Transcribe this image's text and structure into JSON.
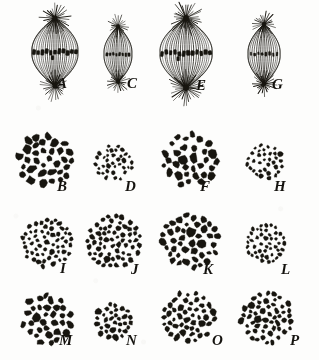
{
  "plate": {
    "kind": "scientific-figure-plate",
    "background_color": "#fdfdfc",
    "ink_color": "#17150f",
    "width": 319,
    "height": 360,
    "rows": 4,
    "columns": 4
  },
  "panels": [
    {
      "id": "A",
      "label": "A",
      "type": "spindle",
      "row": 1,
      "col": 1,
      "cx": 55,
      "cy": 52,
      "spindle_width": 46,
      "spindle_height": 68,
      "fiber_count": 22,
      "aster_rays": 26,
      "aster_radius": 15,
      "chromosome_count": 11,
      "chromosome_size": "large",
      "plate_width": 42,
      "description": "large barrel-shaped mitotic spindle with prominent asters and dense equatorial chromosome plate",
      "label_x": 57,
      "label_y": 89
    },
    {
      "id": "C",
      "label": "C",
      "type": "spindle",
      "row": 1,
      "col": 2,
      "cx": 118,
      "cy": 54,
      "spindle_width": 28,
      "spindle_height": 56,
      "fiber_count": 15,
      "aster_rays": 20,
      "aster_radius": 11,
      "chromosome_count": 8,
      "chromosome_size": "small",
      "plate_width": 22,
      "description": "small narrow spindle with faint equatorial chromosomes",
      "label_x": 127,
      "label_y": 89
    },
    {
      "id": "E",
      "label": "E",
      "type": "spindle",
      "row": 1,
      "col": 3,
      "cx": 186,
      "cy": 53,
      "spindle_width": 52,
      "spindle_height": 70,
      "fiber_count": 24,
      "aster_rays": 30,
      "aster_radius": 17,
      "chromosome_count": 12,
      "chromosome_size": "large",
      "plate_width": 48,
      "description": "large broad spindle with long radiating astral rays and wide chromosome plate",
      "label_x": 196,
      "label_y": 91
    },
    {
      "id": "G",
      "label": "G",
      "type": "spindle",
      "row": 1,
      "col": 4,
      "cx": 264,
      "cy": 54,
      "spindle_width": 32,
      "spindle_height": 60,
      "fiber_count": 16,
      "aster_rays": 22,
      "aster_radius": 12,
      "chromosome_count": 8,
      "chromosome_size": "small",
      "plate_width": 26,
      "description": "medium narrow spindle with small equatorial chromosomes",
      "label_x": 272,
      "label_y": 90
    },
    {
      "id": "B",
      "label": "B",
      "type": "cluster",
      "row": 2,
      "col": 1,
      "cx": 45,
      "cy": 161,
      "radius": 27,
      "dot_count": 40,
      "dot_size": "large",
      "dot_r_min": 2.6,
      "dot_r_max": 4.2,
      "description": "polar view, group of large chromosomes",
      "label_x": 57,
      "label_y": 192
    },
    {
      "id": "D",
      "label": "D",
      "type": "cluster",
      "row": 2,
      "col": 2,
      "cx": 114,
      "cy": 163,
      "radius": 19,
      "dot_count": 36,
      "dot_size": "small",
      "dot_r_min": 1.2,
      "dot_r_max": 2.1,
      "description": "polar view, group of small chromosomes",
      "label_x": 125,
      "label_y": 192
    },
    {
      "id": "F",
      "label": "F",
      "type": "cluster",
      "row": 2,
      "col": 3,
      "cx": 190,
      "cy": 160,
      "radius": 27,
      "dot_count": 38,
      "dot_size": "large",
      "dot_r_min": 2.6,
      "dot_r_max": 4.3,
      "description": "polar view, group of large chromosomes",
      "label_x": 200,
      "label_y": 192
    },
    {
      "id": "H",
      "label": "H",
      "type": "cluster",
      "row": 2,
      "col": 4,
      "cx": 265,
      "cy": 162,
      "radius": 18,
      "dot_count": 34,
      "dot_size": "small",
      "dot_r_min": 1.3,
      "dot_r_max": 2.1,
      "description": "polar view, group of small chromosomes",
      "label_x": 274,
      "label_y": 192
    },
    {
      "id": "I",
      "label": "I",
      "type": "cluster",
      "row": 3,
      "col": 1,
      "cx": 47,
      "cy": 243,
      "radius": 25,
      "dot_count": 58,
      "dot_size": "medium-small",
      "dot_r_min": 1.5,
      "dot_r_max": 2.4,
      "description": "polar view, numerous small chromosomes",
      "label_x": 60,
      "label_y": 274
    },
    {
      "id": "J",
      "label": "J",
      "type": "cluster",
      "row": 3,
      "col": 2,
      "cx": 114,
      "cy": 242,
      "radius": 27,
      "dot_count": 62,
      "dot_size": "medium",
      "dot_r_min": 1.7,
      "dot_r_max": 2.7,
      "description": "polar view, numerous medium chromosomes",
      "label_x": 131,
      "label_y": 275
    },
    {
      "id": "K",
      "label": "K",
      "type": "cluster",
      "row": 3,
      "col": 3,
      "cx": 190,
      "cy": 241,
      "radius": 28,
      "dot_count": 52,
      "dot_size": "large",
      "dot_r_min": 2.2,
      "dot_r_max": 3.8,
      "description": "polar view, numerous large chromosomes",
      "label_x": 203,
      "label_y": 275
    },
    {
      "id": "L",
      "label": "L",
      "type": "cluster",
      "row": 3,
      "col": 4,
      "cx": 266,
      "cy": 243,
      "radius": 20,
      "dot_count": 46,
      "dot_size": "small",
      "dot_r_min": 1.3,
      "dot_r_max": 2.2,
      "description": "polar view, small loose group of chromosomes",
      "label_x": 281,
      "label_y": 275
    },
    {
      "id": "M",
      "label": "M",
      "type": "cluster",
      "row": 4,
      "col": 1,
      "cx": 47,
      "cy": 319,
      "radius": 25,
      "dot_count": 40,
      "dot_size": "large",
      "dot_r_min": 2.4,
      "dot_r_max": 4.0,
      "description": "polar view, group of large chromosomes",
      "label_x": 59,
      "label_y": 346
    },
    {
      "id": "N",
      "label": "N",
      "type": "cluster",
      "row": 4,
      "col": 2,
      "cx": 113,
      "cy": 321,
      "radius": 18,
      "dot_count": 34,
      "dot_size": "medium",
      "dot_r_min": 1.7,
      "dot_r_max": 2.9,
      "description": "polar view, small group of chromosomes",
      "label_x": 126,
      "label_y": 346
    },
    {
      "id": "O",
      "label": "O",
      "type": "cluster",
      "row": 4,
      "col": 3,
      "cx": 189,
      "cy": 317,
      "radius": 26,
      "dot_count": 50,
      "dot_size": "medium",
      "dot_r_min": 1.9,
      "dot_r_max": 3.2,
      "description": "polar view, group of medium chromosomes",
      "label_x": 212,
      "label_y": 346
    },
    {
      "id": "P",
      "label": "P",
      "type": "cluster",
      "row": 4,
      "col": 4,
      "cx": 267,
      "cy": 318,
      "radius": 26,
      "dot_count": 56,
      "dot_size": "medium",
      "dot_r_min": 1.8,
      "dot_r_max": 3.1,
      "description": "polar view, group of medium chromosomes",
      "label_x": 290,
      "label_y": 346
    }
  ]
}
